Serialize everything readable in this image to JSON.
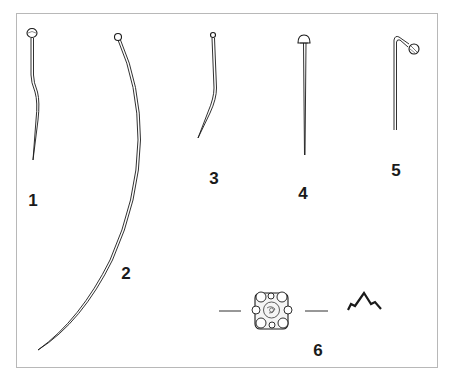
{
  "figure": {
    "objects": [
      {
        "id": "1",
        "label": "1",
        "kind": "pin",
        "head": "globular"
      },
      {
        "id": "2",
        "label": "2",
        "kind": "pin",
        "head": "small-round",
        "shape": "long-curved"
      },
      {
        "id": "3",
        "label": "3",
        "kind": "pin",
        "head": "small-round",
        "shape": "bent-tip"
      },
      {
        "id": "4",
        "label": "4",
        "kind": "pin",
        "head": "mushroom"
      },
      {
        "id": "5",
        "label": "5",
        "kind": "pin",
        "head": "hooked-round"
      },
      {
        "id": "6",
        "label": "6",
        "kind": "ornament",
        "view": "face-and-profile"
      }
    ],
    "caption": "",
    "colors": {
      "ink": "#1a1a1a",
      "frame": "#b8b8b8",
      "background": "#ffffff"
    }
  }
}
